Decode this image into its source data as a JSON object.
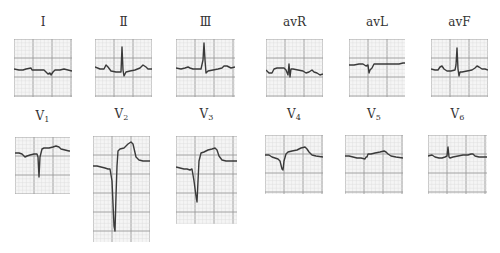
{
  "figure": {
    "grid": {
      "minor_color": "#dcdcdc",
      "major_color": "#9a9a9a",
      "trace_color": "#3a3a3a",
      "background": "#f5f5f5"
    },
    "limb_leads": [
      {
        "id": "I",
        "label": "Ⅰ",
        "x": 14,
        "y": 39,
        "w": 58,
        "h": 58,
        "label_y": 12,
        "trace": "0,30 5,31 9,31 12,30 17,29 18,31 23,31 28,31 30,31 34,35 36,34 37,36 39,33 41,31 46,31 50,30 58,32"
      },
      {
        "id": "II",
        "label": "Ⅱ",
        "x": 95,
        "y": 39,
        "w": 57,
        "h": 58,
        "label_y": 12,
        "trace": "0,28 5,30 9,30 11,26 13,28 16,32 21,33 24,33 26,33 27,8 28,31 29,37 31,33 35,32 40,31 45,29 48,26 51,28 53,30 57,30"
      },
      {
        "id": "III",
        "label": "Ⅲ",
        "x": 176,
        "y": 39,
        "w": 59,
        "h": 58,
        "label_y": 12,
        "trace": "0,29 5,30 9,29 12,28 14,29 17,30 22,30 25,30 27,21 28,4 29,21 30,34 32,32 37,31 42,30 46,29 48,27 51,27 53,28 55,29 59,28"
      },
      {
        "id": "avR",
        "label": "avR",
        "x": 266,
        "y": 39,
        "w": 57,
        "h": 58,
        "label_y": 12,
        "trace": "0,31 3,34 6,34 8,30 11,29 15,29 18,29 20,31 22,36 23,25 24,38 25,30 27,30 32,31 37,32 40,34 43,33 46,31 48,33 51,34 54,36 57,35"
      },
      {
        "id": "avL",
        "label": "avL",
        "x": 349,
        "y": 39,
        "w": 56,
        "h": 58,
        "label_y": 12,
        "trace": "0,26 5,26 10,25 14,25 17,27 19,26 20,34 21,31 23,29 25,25 28,25 32,25 37,25 42,25 46,25 50,25 54,24 56,24"
      },
      {
        "id": "avF",
        "label": "avF",
        "x": 431,
        "y": 39,
        "w": 57,
        "h": 58,
        "label_y": 12,
        "trace": "0,30 4,31 7,31 9,28 11,27 13,30 16,32 20,32 24,31 25,26 26,9 27,30 28,37 29,33 31,33 36,32 41,31 44,29 46,27 48,28 51,30 54,30 57,31"
      }
    ],
    "precordial_leads": [
      {
        "id": "V1",
        "label_main": "V",
        "label_sub": "1",
        "x": 15,
        "y": 137,
        "w": 55,
        "h": 57,
        "label_y": 16,
        "trace": "0,16 4,16 7,17 10,20 12,19 15,18 19,17 22,17 23,20 24,40 25,20 27,12 29,11 34,11 38,10 41,9 44,10 46,12 50,13 54,14 55,14"
      },
      {
        "id": "V2",
        "label_main": "V",
        "label_sub": "2",
        "x": 93,
        "y": 136,
        "w": 57,
        "h": 106,
        "label_y": 17,
        "trace": "0,30 4,30 8,31 12,32 15,33 17,33 19,45 21,90 22,95 23,60 24,30 25,15 27,13 31,12 35,8 38,6 40,8 43,21 46,24 50,25 57,25"
      },
      {
        "id": "V3",
        "label_main": "V",
        "label_sub": "3",
        "x": 176,
        "y": 136,
        "w": 61,
        "h": 88,
        "label_y": 17,
        "trace": "0,31 4,32 8,33 11,33 14,34 16,33 18,45 20,60 21,66 22,45 23,25 25,17 28,16 32,14 36,13 39,12 41,14 43,20 46,24 50,25 56,25 61,25"
      },
      {
        "id": "V4",
        "label_main": "V",
        "label_sub": "4",
        "x": 265,
        "y": 135,
        "w": 58,
        "h": 59,
        "label_y": 16,
        "trace": "0,20 4,20 7,22 10,23 13,24 15,26 17,34 18,35 19,26 21,19 23,17 27,16 32,15 36,13 40,12 42,14 44,17 47,20 51,21 58,22"
      },
      {
        "id": "V5",
        "label_main": "V",
        "label_sub": "5",
        "x": 345,
        "y": 135,
        "w": 58,
        "h": 59,
        "label_y": 16,
        "trace": "0,21 4,21 8,22 12,23 16,23 20,24 21,22 22,22 23,19 26,19 30,18 35,17 39,16 41,17 43,19 46,21 51,22 58,23"
      },
      {
        "id": "V6",
        "label_main": "V",
        "label_sub": "6",
        "x": 428,
        "y": 135,
        "w": 59,
        "h": 59,
        "label_y": 16,
        "trace": "0,21 4,20 7,22 11,23 14,23 17,22 19,21 20,12 21,22 22,23 25,22 30,21 35,20 40,20 43,19 45,19 47,21 51,22 55,22 59,22"
      }
    ]
  }
}
